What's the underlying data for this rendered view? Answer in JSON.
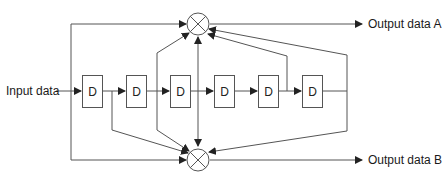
{
  "diagram": {
    "type": "convolutional-encoder",
    "input_label": "Input data",
    "output_a_label": "Output data A",
    "output_b_label": "Output data B",
    "delay_label": "D",
    "delay_count": 6,
    "delays": [
      {
        "label": "D"
      },
      {
        "label": "D"
      },
      {
        "label": "D"
      },
      {
        "label": "D"
      },
      {
        "label": "D"
      },
      {
        "label": "D"
      }
    ],
    "xor_nodes": [
      {
        "name": "adder-a",
        "output": "Output data A"
      },
      {
        "name": "adder-b",
        "output": "Output data B"
      }
    ],
    "line_color": "#555555"
  }
}
